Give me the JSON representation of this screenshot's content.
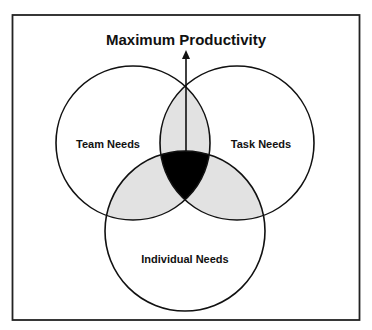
{
  "diagram": {
    "title": "Maximum Productivity",
    "circles": [
      {
        "id": "team",
        "label": "Team Needs",
        "cx": 133,
        "cy": 143,
        "r": 77
      },
      {
        "id": "task",
        "label": "Task Needs",
        "cx": 237,
        "cy": 143,
        "r": 77
      },
      {
        "id": "individual",
        "label": "Individual Needs",
        "cx": 185,
        "cy": 231,
        "r": 80
      }
    ],
    "arrow": {
      "from_label": "center-overlap",
      "to_label": "Maximum Productivity",
      "direction": "up"
    },
    "colors": {
      "stroke": "#111111",
      "pairwise_overlap_fill": "#e2e2e2",
      "triple_overlap_fill": "#000000",
      "frame": "#222222",
      "background": "#ffffff"
    }
  }
}
